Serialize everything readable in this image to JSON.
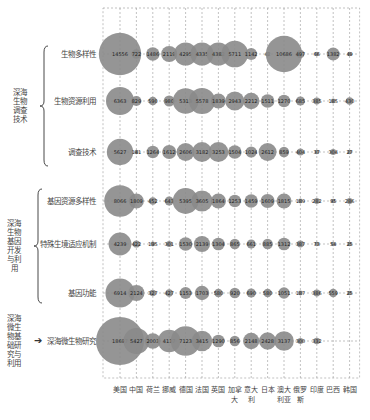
{
  "chart_data": {
    "type": "bubble",
    "title": "",
    "xlabel": "",
    "ylabel": "",
    "grid": "dashed vertical lines per country, dashed frame",
    "categories": [
      "美国",
      "中国",
      "荷兰",
      "挪威",
      "德国",
      "法国",
      "英国",
      "加拿大",
      "意大利",
      "日本",
      "澳大利亚",
      "俄罗斯",
      "印度",
      "巴西",
      "韩国"
    ],
    "x_tick_labels": [
      {
        "line1": "美国",
        "line2": ""
      },
      {
        "line1": "中国",
        "line2": ""
      },
      {
        "line1": "荷兰",
        "line2": ""
      },
      {
        "line1": "挪威",
        "line2": ""
      },
      {
        "line1": "德国",
        "line2": ""
      },
      {
        "line1": "法国",
        "line2": ""
      },
      {
        "line1": "英国",
        "line2": ""
      },
      {
        "line1": "加拿",
        "line2": "大"
      },
      {
        "line1": "意大",
        "line2": "利"
      },
      {
        "line1": "日本",
        "line2": ""
      },
      {
        "line1": "澳大",
        "line2": "利亚"
      },
      {
        "line1": "俄罗",
        "line2": "斯"
      },
      {
        "line1": "印度",
        "line2": ""
      },
      {
        "line1": "巴西",
        "line2": ""
      },
      {
        "line1": "韩国",
        "line2": ""
      }
    ],
    "groups": [
      {
        "label": "深海生物调查技术",
        "display": "深海\n生物\n调查\n技术",
        "rows": [
          0,
          1,
          2
        ]
      },
      {
        "label": "深海生物基因开发与利用",
        "display": "深海\n生物\n基因\n开发\n与利\n用",
        "rows": [
          3,
          4,
          5
        ]
      },
      {
        "label": "深海微生物基础研究与利用",
        "display": "深海\n微生\n物基\n础研\n究与\n利用",
        "rows": [
          6
        ]
      }
    ],
    "series": [
      {
        "name": "生物多样性",
        "values": [
          14556,
          722,
          1486,
          2119,
          4295,
          4335,
          4382,
          5711,
          1142,
          42,
          10686,
          497,
          66,
          1382,
          49
        ]
      },
      {
        "name": "生物资源利用",
        "values": [
          6363,
          829,
          590,
          980,
          5313,
          5578,
          1839,
          2943,
          2212,
          1511,
          1270,
          685,
          385,
          185,
          430
        ]
      },
      {
        "name": "调查技术",
        "values": [
          5627,
          141,
          1264,
          1612,
          2606,
          3182,
          3253,
          1504,
          1024,
          2612,
          859,
          404,
          37,
          304,
          27
        ]
      },
      {
        "name": "基因资源多样性",
        "values": [
          8066,
          1809,
          452,
          643,
          5395,
          3605,
          1864,
          1253,
          1459,
          1609,
          1815,
          189,
          282,
          95,
          286
        ]
      },
      {
        "name": "特殊生境适应机制",
        "values": [
          4239,
          422,
          195,
          301,
          1530,
          2139,
          1304,
          865,
          661,
          885,
          1312,
          387,
          73,
          54,
          25
        ]
      },
      {
        "name": "基因功能",
        "values": [
          6914,
          2124,
          327,
          427,
          1153,
          1703,
          580,
          920,
          690,
          580,
          1051,
          187,
          386,
          559,
          25
        ]
      },
      {
        "name": "深海微生物研究",
        "values": [
          18697,
          5427,
          2003,
          4137,
          7123,
          3415,
          1290,
          856,
          2148,
          2428,
          3137,
          300,
          332,
          null,
          null
        ]
      }
    ]
  },
  "colors": {
    "bubble": "#8a8a8a",
    "grid": "#999999",
    "text": "#444444"
  }
}
